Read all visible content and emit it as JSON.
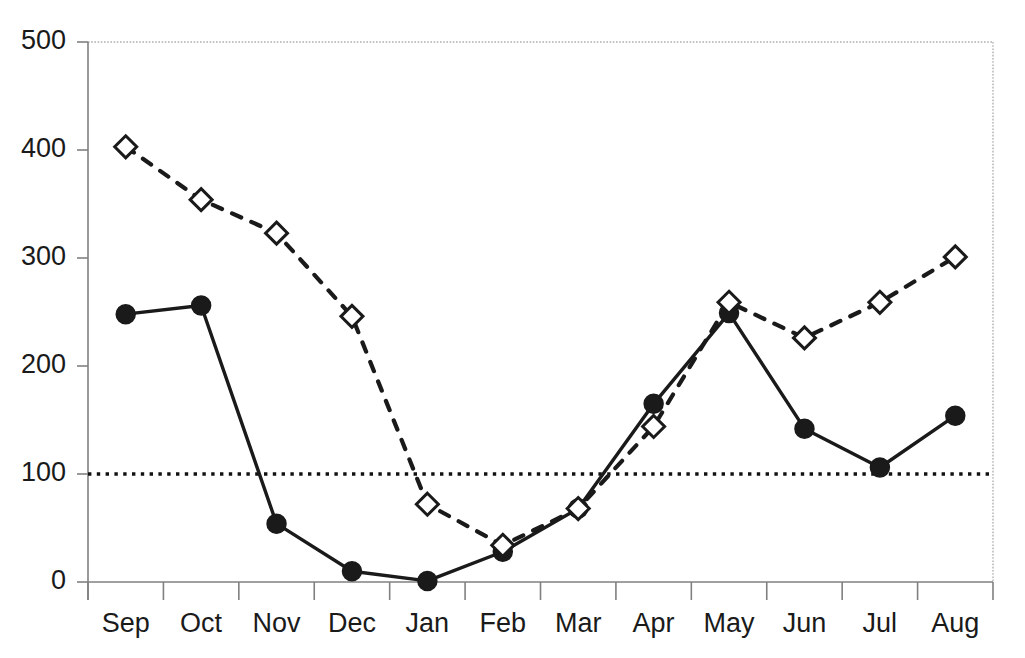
{
  "chart_data": {
    "type": "line",
    "title": "",
    "subtitle": "",
    "xlabel": "",
    "ylabel": "",
    "categories": [
      "Sep",
      "Oct",
      "Nov",
      "Dec",
      "Jan",
      "Feb",
      "Mar",
      "Apr",
      "May",
      "Jun",
      "Jul",
      "Aug"
    ],
    "ylim": [
      0,
      500
    ],
    "yticks": [
      0,
      100,
      200,
      300,
      400,
      500
    ],
    "ytick_labels": [
      "0",
      "100",
      "200",
      "300",
      "400",
      "500"
    ],
    "grid": false,
    "legend": null,
    "series": [
      {
        "name": "solid-circle-series",
        "marker": "filled-circle",
        "linestyle": "solid",
        "color": "#1a1a1a",
        "values": [
          248,
          256,
          54,
          10,
          1,
          28,
          68,
          165,
          249,
          142,
          106,
          154
        ]
      },
      {
        "name": "dashed-diamond-series",
        "marker": "open-diamond",
        "linestyle": "dashed",
        "color": "#1a1a1a",
        "values": [
          403,
          354,
          323,
          246,
          72,
          34,
          68,
          144,
          259,
          226,
          259,
          301
        ]
      }
    ],
    "reference_lines": [
      {
        "name": "threshold-100",
        "value": 100,
        "linestyle": "dotted",
        "color": "#111111"
      }
    ],
    "axis_color": "#808080",
    "border_color": "#b0b0b0"
  }
}
